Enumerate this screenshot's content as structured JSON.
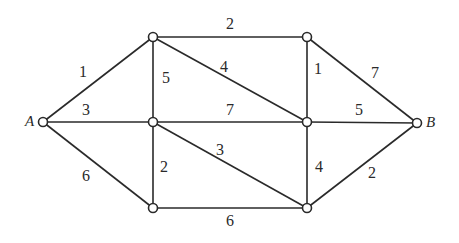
{
  "graph": {
    "type": "weighted-undirected-graph",
    "nodes": [
      {
        "id": "A",
        "label": "A"
      },
      {
        "id": "T1",
        "label": ""
      },
      {
        "id": "M1",
        "label": ""
      },
      {
        "id": "B1",
        "label": ""
      },
      {
        "id": "T2",
        "label": ""
      },
      {
        "id": "M2",
        "label": ""
      },
      {
        "id": "B2",
        "label": ""
      },
      {
        "id": "B",
        "label": "B"
      }
    ],
    "edges": [
      {
        "from": "A",
        "to": "T1",
        "weight": "1"
      },
      {
        "from": "A",
        "to": "M1",
        "weight": "3"
      },
      {
        "from": "A",
        "to": "B1",
        "weight": "6"
      },
      {
        "from": "T1",
        "to": "T2",
        "weight": "2"
      },
      {
        "from": "T1",
        "to": "M1",
        "weight": "5"
      },
      {
        "from": "T1",
        "to": "M2",
        "weight": "4"
      },
      {
        "from": "M1",
        "to": "M2",
        "weight": "7"
      },
      {
        "from": "M1",
        "to": "B1",
        "weight": "2"
      },
      {
        "from": "M1",
        "to": "B2",
        "weight": "3"
      },
      {
        "from": "B1",
        "to": "B2",
        "weight": "6"
      },
      {
        "from": "T2",
        "to": "M2",
        "weight": "1"
      },
      {
        "from": "T2",
        "to": "B",
        "weight": "7"
      },
      {
        "from": "M2",
        "to": "B",
        "weight": "5"
      },
      {
        "from": "M2",
        "to": "B2",
        "weight": "4"
      },
      {
        "from": "B2",
        "to": "B",
        "weight": "2"
      }
    ]
  }
}
